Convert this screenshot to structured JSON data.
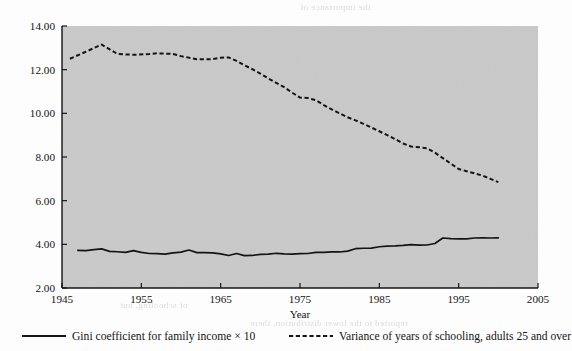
{
  "chart_data": {
    "type": "line",
    "title": "",
    "xlabel": "Year",
    "ylabel": "",
    "xlim": [
      1945,
      2005
    ],
    "ylim": [
      2.0,
      14.0
    ],
    "xticks": [
      "1945",
      "1955",
      "1965",
      "1975",
      "1985",
      "1995",
      "2005"
    ],
    "yticks": [
      "2.00",
      "4.00",
      "6.00",
      "8.00",
      "10.00",
      "12.00",
      "14.00"
    ],
    "grid": false,
    "legend_position": "bottom",
    "plot_background": "#c9c9c9",
    "line_color": "#141414",
    "series": [
      {
        "name": "Gini coefficient for family income × 10",
        "style": "solid",
        "x": [
          1947,
          1948,
          1949,
          1950,
          1951,
          1952,
          1953,
          1954,
          1955,
          1956,
          1957,
          1958,
          1959,
          1960,
          1961,
          1962,
          1963,
          1964,
          1965,
          1966,
          1967,
          1968,
          1969,
          1970,
          1971,
          1972,
          1973,
          1974,
          1975,
          1976,
          1977,
          1978,
          1979,
          1980,
          1981,
          1982,
          1983,
          1984,
          1985,
          1986,
          1987,
          1988,
          1989,
          1990,
          1991,
          1992,
          1993,
          1994,
          1995,
          1996,
          1997,
          1998,
          1999,
          2000
        ],
        "values": [
          3.72,
          3.71,
          3.76,
          3.79,
          3.68,
          3.66,
          3.63,
          3.71,
          3.63,
          3.58,
          3.57,
          3.55,
          3.61,
          3.64,
          3.74,
          3.62,
          3.62,
          3.61,
          3.56,
          3.49,
          3.58,
          3.48,
          3.49,
          3.54,
          3.55,
          3.59,
          3.56,
          3.55,
          3.57,
          3.58,
          3.63,
          3.63,
          3.65,
          3.65,
          3.69,
          3.8,
          3.82,
          3.83,
          3.89,
          3.92,
          3.93,
          3.95,
          3.99,
          3.96,
          3.97,
          4.04,
          4.29,
          4.26,
          4.25,
          4.25,
          4.29,
          4.3,
          4.29,
          4.3
        ]
      },
      {
        "name": "Variance of years of schooling, adults 25 and over",
        "style": "dashed",
        "x": [
          1946,
          1948,
          1950,
          1952,
          1954,
          1956,
          1957,
          1959,
          1960,
          1962,
          1964,
          1965,
          1966,
          1967,
          1968,
          1969,
          1970,
          1971,
          1972,
          1973,
          1974,
          1975,
          1976,
          1977,
          1978,
          1979,
          1980,
          1981,
          1982,
          1983,
          1984,
          1985,
          1986,
          1987,
          1988,
          1989,
          1990,
          1991,
          1992,
          1993,
          1994,
          1995,
          1996,
          1997,
          1998,
          1999,
          2000
        ],
        "values": [
          12.5,
          12.82,
          13.15,
          12.72,
          12.68,
          12.72,
          12.75,
          12.72,
          12.62,
          12.48,
          12.48,
          12.55,
          12.56,
          12.4,
          12.2,
          12.02,
          11.82,
          11.6,
          11.4,
          11.2,
          10.95,
          10.72,
          10.7,
          10.6,
          10.38,
          10.18,
          10.0,
          9.82,
          9.68,
          9.52,
          9.35,
          9.18,
          9.0,
          8.82,
          8.62,
          8.48,
          8.45,
          8.4,
          8.2,
          7.95,
          7.7,
          7.45,
          7.35,
          7.25,
          7.15,
          7.0,
          6.85
        ]
      }
    ]
  },
  "axis": {
    "x_title": "Year"
  },
  "legend": {
    "items": [
      {
        "label": "Gini coefficient for family income × 10",
        "style": "solid"
      },
      {
        "label": "Variance of years of schooling, adults 25 and over",
        "style": "dashed"
      }
    ]
  },
  "background_text": {
    "lines": [
      "the importance of",
      "a great impact on",
      "of schooling, but",
      "reported to the lower distribution, there"
    ]
  }
}
